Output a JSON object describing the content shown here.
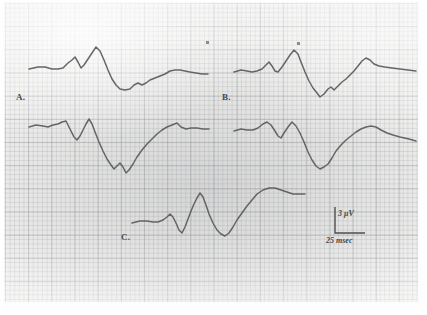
{
  "figure": {
    "medium": "scanned chart recording",
    "paper_color": "#eeeeec",
    "trace_color": "#5a5a5c",
    "grid_major_color": "#96989e",
    "grid_minor_color": "#a8aab0"
  },
  "labels": {
    "a": "A.",
    "b": "B.",
    "c": "C."
  },
  "scale_bar": {
    "amplitude_label": "3 μV",
    "time_label": "25 msec",
    "amplitude_value": 3,
    "amplitude_units": "μV",
    "time_value": 25,
    "time_units": "msec"
  },
  "chart_data": {
    "type": "line",
    "xlabel": "",
    "ylabel": "",
    "grid": true,
    "legend": "none",
    "axis_note": "No numeric axes; calibration given by scale bar (3 μV vertical, 25 msec horizontal).",
    "series": [
      {
        "name": "A. upper trace (left column, row 1)",
        "label": "A.",
        "points_px": [
          [
            29,
            69
          ],
          [
            38,
            67
          ],
          [
            45,
            67
          ],
          [
            52,
            69
          ],
          [
            58,
            69
          ],
          [
            63,
            68
          ],
          [
            68,
            63
          ],
          [
            72,
            60
          ],
          [
            75,
            57
          ],
          [
            78,
            62
          ],
          [
            81,
            68
          ],
          [
            84,
            65
          ],
          [
            88,
            59
          ],
          [
            92,
            53
          ],
          [
            96,
            47
          ],
          [
            100,
            51
          ],
          [
            104,
            60
          ],
          [
            108,
            70
          ],
          [
            112,
            79
          ],
          [
            116,
            85
          ],
          [
            120,
            89
          ],
          [
            125,
            90
          ],
          [
            130,
            89
          ],
          [
            134,
            85
          ],
          [
            138,
            83
          ],
          [
            142,
            85
          ],
          [
            146,
            83
          ],
          [
            150,
            80
          ],
          [
            155,
            78
          ],
          [
            160,
            76
          ],
          [
            165,
            74
          ],
          [
            170,
            71
          ],
          [
            175,
            70
          ],
          [
            180,
            70
          ],
          [
            185,
            71
          ],
          [
            190,
            72
          ],
          [
            196,
            73
          ],
          [
            202,
            74
          ],
          [
            208,
            74
          ]
        ]
      },
      {
        "name": "A. lower trace (left column, row 2)",
        "label": "",
        "points_px": [
          [
            29,
            127
          ],
          [
            36,
            125
          ],
          [
            43,
            126
          ],
          [
            48,
            127
          ],
          [
            53,
            125
          ],
          [
            58,
            124
          ],
          [
            62,
            122
          ],
          [
            66,
            121
          ],
          [
            68,
            125
          ],
          [
            71,
            131
          ],
          [
            74,
            137
          ],
          [
            77,
            140
          ],
          [
            80,
            136
          ],
          [
            83,
            130
          ],
          [
            86,
            124
          ],
          [
            89,
            119
          ],
          [
            92,
            124
          ],
          [
            95,
            132
          ],
          [
            99,
            142
          ],
          [
            103,
            151
          ],
          [
            107,
            159
          ],
          [
            111,
            165
          ],
          [
            114,
            169
          ],
          [
            117,
            166
          ],
          [
            120,
            163
          ],
          [
            123,
            167
          ],
          [
            126,
            173
          ],
          [
            129,
            170
          ],
          [
            133,
            164
          ],
          [
            137,
            157
          ],
          [
            142,
            150
          ],
          [
            147,
            144
          ],
          [
            152,
            139
          ],
          [
            157,
            134
          ],
          [
            162,
            130
          ],
          [
            167,
            127
          ],
          [
            172,
            125
          ],
          [
            177,
            123
          ],
          [
            181,
            127
          ],
          [
            186,
            129
          ],
          [
            191,
            128
          ],
          [
            197,
            128
          ],
          [
            203,
            129
          ],
          [
            209,
            129
          ]
        ]
      },
      {
        "name": "B. upper trace (right column, row 1)",
        "label": "B.",
        "points_px": [
          [
            234,
            72
          ],
          [
            241,
            70
          ],
          [
            247,
            71
          ],
          [
            252,
            72
          ],
          [
            257,
            71
          ],
          [
            262,
            69
          ],
          [
            266,
            65
          ],
          [
            269,
            62
          ],
          [
            272,
            66
          ],
          [
            275,
            71
          ],
          [
            278,
            72
          ],
          [
            282,
            67
          ],
          [
            286,
            61
          ],
          [
            290,
            55
          ],
          [
            294,
            50
          ],
          [
            298,
            54
          ],
          [
            301,
            62
          ],
          [
            305,
            72
          ],
          [
            309,
            81
          ],
          [
            313,
            88
          ],
          [
            317,
            93
          ],
          [
            320,
            97
          ],
          [
            324,
            94
          ],
          [
            328,
            89
          ],
          [
            331,
            87
          ],
          [
            334,
            90
          ],
          [
            338,
            86
          ],
          [
            342,
            82
          ],
          [
            346,
            79
          ],
          [
            350,
            75
          ],
          [
            354,
            71
          ],
          [
            358,
            66
          ],
          [
            362,
            61
          ],
          [
            366,
            58
          ],
          [
            370,
            60
          ],
          [
            374,
            64
          ],
          [
            379,
            66
          ],
          [
            385,
            67
          ],
          [
            392,
            68
          ],
          [
            400,
            69
          ],
          [
            408,
            70
          ],
          [
            416,
            71
          ]
        ]
      },
      {
        "name": "B. lower trace (right column, row 2)",
        "label": "",
        "points_px": [
          [
            234,
            131
          ],
          [
            241,
            129
          ],
          [
            247,
            130
          ],
          [
            253,
            130
          ],
          [
            258,
            128
          ],
          [
            263,
            124
          ],
          [
            267,
            122
          ],
          [
            271,
            125
          ],
          [
            275,
            131
          ],
          [
            278,
            136
          ],
          [
            281,
            138
          ],
          [
            284,
            133
          ],
          [
            288,
            127
          ],
          [
            292,
            122
          ],
          [
            296,
            126
          ],
          [
            300,
            133
          ],
          [
            304,
            142
          ],
          [
            308,
            152
          ],
          [
            312,
            160
          ],
          [
            316,
            166
          ],
          [
            320,
            169
          ],
          [
            324,
            167
          ],
          [
            328,
            164
          ],
          [
            332,
            158
          ],
          [
            336,
            151
          ],
          [
            341,
            145
          ],
          [
            346,
            140
          ],
          [
            351,
            136
          ],
          [
            356,
            132
          ],
          [
            361,
            129
          ],
          [
            366,
            127
          ],
          [
            371,
            126
          ],
          [
            376,
            127
          ],
          [
            381,
            130
          ],
          [
            387,
            133
          ],
          [
            393,
            135
          ],
          [
            400,
            137
          ],
          [
            409,
            139
          ],
          [
            416,
            141
          ]
        ]
      },
      {
        "name": "C. trace (bottom centre)",
        "label": "C.",
        "points_px": [
          [
            132,
            223
          ],
          [
            140,
            221
          ],
          [
            147,
            221
          ],
          [
            153,
            222
          ],
          [
            158,
            222
          ],
          [
            163,
            220
          ],
          [
            167,
            217
          ],
          [
            170,
            214
          ],
          [
            173,
            217
          ],
          [
            176,
            223
          ],
          [
            179,
            230
          ],
          [
            182,
            233
          ],
          [
            185,
            227
          ],
          [
            188,
            219
          ],
          [
            191,
            211
          ],
          [
            194,
            204
          ],
          [
            197,
            198
          ],
          [
            200,
            193
          ],
          [
            203,
            197
          ],
          [
            206,
            205
          ],
          [
            209,
            214
          ],
          [
            213,
            223
          ],
          [
            217,
            230
          ],
          [
            221,
            234
          ],
          [
            225,
            236
          ],
          [
            229,
            233
          ],
          [
            233,
            227
          ],
          [
            237,
            220
          ],
          [
            242,
            213
          ],
          [
            247,
            206
          ],
          [
            252,
            200
          ],
          [
            257,
            194
          ],
          [
            263,
            190
          ],
          [
            269,
            188
          ],
          [
            275,
            188
          ],
          [
            281,
            190
          ],
          [
            287,
            192
          ],
          [
            293,
            194
          ],
          [
            299,
            194
          ],
          [
            305,
            194
          ]
        ]
      }
    ],
    "markers_px": [
      [
        206,
        41
      ],
      [
        297,
        42
      ]
    ]
  }
}
